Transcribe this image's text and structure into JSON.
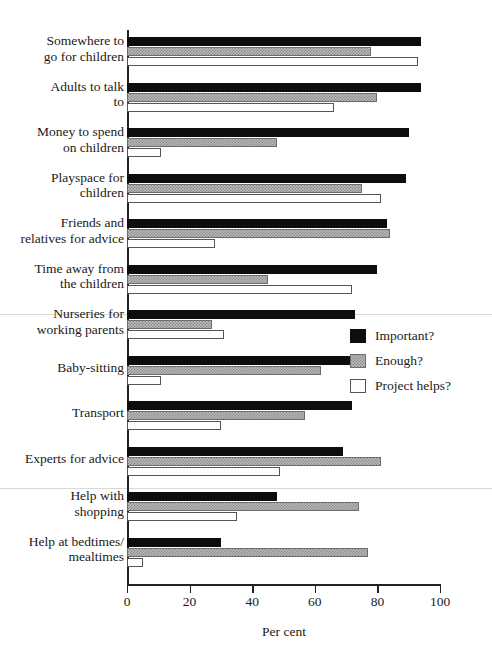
{
  "chart_data": {
    "type": "bar",
    "orientation": "horizontal",
    "title": "",
    "xlabel": "Per cent",
    "ylabel": "",
    "xlim": [
      0,
      100
    ],
    "xticks": [
      0,
      20,
      40,
      60,
      80,
      100
    ],
    "xtick_labels": [
      "0",
      "20",
      "40",
      "60",
      "80",
      "100"
    ],
    "grid": false,
    "legend_position": "center-right",
    "categories": [
      "Somewhere to go for children",
      "Adults to talk to",
      "Money to spend on children",
      "Playspace for children",
      "Friends and relatives for advice",
      "Time away from the children",
      "Nurseries for working parents",
      "Baby-sitting",
      "Transport",
      "Experts for advice",
      "Help with shopping",
      "Help at bedtimes/ mealtimes"
    ],
    "series": [
      {
        "name": "Important?",
        "color": "#0d0d0d",
        "values": [
          94,
          94,
          90,
          89,
          83,
          80,
          73,
          72,
          72,
          69,
          48,
          30
        ]
      },
      {
        "name": "Enough?",
        "color": "#b9b9b9",
        "values": [
          78,
          80,
          48,
          75,
          84,
          45,
          27,
          62,
          57,
          81,
          74,
          77
        ]
      },
      {
        "name": "Project helps?",
        "color": "#fefefe",
        "values": [
          93,
          66,
          11,
          81,
          28,
          72,
          31,
          11,
          30,
          49,
          35,
          5
        ]
      }
    ]
  },
  "axis": {
    "x_title": "Per cent"
  },
  "categories_display": [
    {
      "line1": "Somewhere to",
      "line2": "go for children"
    },
    {
      "line1": "Adults to talk",
      "line2": "to"
    },
    {
      "line1": "Money to spend",
      "line2": "on children"
    },
    {
      "line1": "Playspace for",
      "line2": "children"
    },
    {
      "line1": "Friends and",
      "line2": "relatives for advice"
    },
    {
      "line1": "Time away from",
      "line2": "the children"
    },
    {
      "line1": "Nurseries for",
      "line2": "working parents"
    },
    {
      "line1": "Baby-sitting",
      "line2": ""
    },
    {
      "line1": "Transport",
      "line2": ""
    },
    {
      "line1": "Experts for advice",
      "line2": ""
    },
    {
      "line1": "Help with",
      "line2": "shopping"
    },
    {
      "line1": "Help at bedtimes/",
      "line2": "mealtimes"
    }
  ],
  "legend": {
    "items": [
      {
        "label": "Important?",
        "key": "important"
      },
      {
        "label": "Enough?",
        "key": "enough"
      },
      {
        "label": "Project helps?",
        "key": "helps"
      }
    ]
  },
  "colors": {
    "important": "#0d0d0d",
    "enough": "#b9b9b9",
    "helps": "#fefefe",
    "axis": "#222222",
    "separator": "#d8d8d6"
  }
}
